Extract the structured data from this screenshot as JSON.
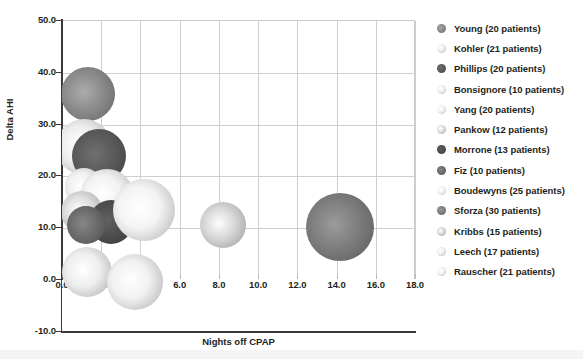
{
  "chart_data": {
    "type": "scatter",
    "title": "",
    "xlabel": "Nights off CPAP",
    "ylabel": "Delta AHI",
    "xlim": [
      0.0,
      18.0
    ],
    "ylim": [
      -10.0,
      50.0
    ],
    "xticks": [
      "0.0",
      "2.0",
      "4.0",
      "6.0",
      "8.0",
      "10.0",
      "12.0",
      "14.0",
      "16.0",
      "18.0"
    ],
    "yticks": [
      "50.0",
      "40.0",
      "30.0",
      "20.0",
      "10.0",
      "0.0",
      "-10.0"
    ],
    "xtick_values": [
      0,
      2,
      4,
      6,
      8,
      10,
      12,
      14,
      16,
      18
    ],
    "ytick_values": [
      50,
      40,
      30,
      20,
      10,
      0,
      -10
    ],
    "grid": true,
    "legend_position": "right",
    "size_encoding": "patients",
    "series": [
      {
        "name": "Young",
        "label": "Young (20 patients)",
        "patients": 20,
        "x": 1.3,
        "y": 35.8,
        "color": "#8d8d8d",
        "r": 27
      },
      {
        "name": "Kohler",
        "label": "Kohler (21 patients)",
        "patients": 21,
        "x": 1.1,
        "y": 25.5,
        "color": "#ededed",
        "r": 28
      },
      {
        "name": "Phillips",
        "label": "Phillips (20 patients)",
        "patients": 20,
        "x": 1.9,
        "y": 23.8,
        "color": "#5c5c5c",
        "r": 27
      },
      {
        "name": "Bonsignore",
        "label": "Bonsignore (10 patients)",
        "patients": 10,
        "x": 1.1,
        "y": 17.8,
        "color": "#f0f0f0",
        "r": 19
      },
      {
        "name": "Yang",
        "label": "Yang (20 patients)",
        "patients": 20,
        "x": 2.3,
        "y": 16.0,
        "color": "#f2f2f2",
        "r": 27
      },
      {
        "name": "Pankow",
        "label": "Pankow (12 patients)",
        "patients": 12,
        "x": 1.0,
        "y": 13.0,
        "color": "#dcdcdc",
        "r": 21
      },
      {
        "name": "Morrone",
        "label": "Morrone (13 patients)",
        "patients": 13,
        "x": 2.5,
        "y": 11.0,
        "color": "#4f4f4f",
        "r": 22
      },
      {
        "name": "Fiz",
        "label": "Fiz (10 patients)",
        "patients": 10,
        "x": 1.2,
        "y": 10.5,
        "color": "#6e6e6e",
        "r": 19
      },
      {
        "name": "Boudewyns",
        "label": "Boudewyns (25 patients)",
        "patients": 25,
        "x": 4.2,
        "y": 13.4,
        "color": "#f4f4f4",
        "r": 31
      },
      {
        "name": "Sforza",
        "label": "Sforza (30 patients)",
        "patients": 30,
        "x": 14.2,
        "y": 10.0,
        "color": "#7f7f7f",
        "r": 34
      },
      {
        "name": "Kribbs",
        "label": "Kribbs (15 patients)",
        "patients": 15,
        "x": 8.2,
        "y": 10.4,
        "color": "#d7d7d7",
        "r": 23
      },
      {
        "name": "Leech",
        "label": "Leech (17 patients)",
        "patients": 17,
        "x": 1.3,
        "y": 1.4,
        "color": "#eeeeee",
        "r": 25
      },
      {
        "name": "Rauscher",
        "label": "Rauscher (21 patients)",
        "patients": 21,
        "x": 3.7,
        "y": -0.5,
        "color": "#f1f1f1",
        "r": 28
      }
    ]
  }
}
